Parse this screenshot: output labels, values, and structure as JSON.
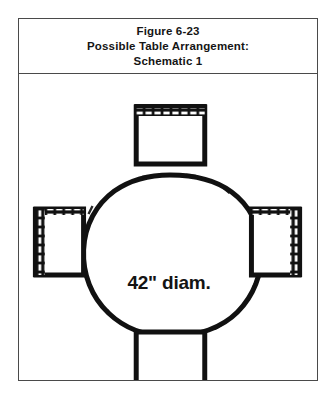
{
  "figure": {
    "title_lines": [
      "Figure 6-23",
      "Possible Table Arrangement:",
      "Schematic 1"
    ],
    "table": {
      "label": "42\" diam.",
      "shape": "circle",
      "diameter_inches": 42
    },
    "chairs": [
      {
        "position": "top",
        "back_edge": "top"
      },
      {
        "position": "left",
        "back_edge": "left"
      },
      {
        "position": "right",
        "back_edge": "right"
      },
      {
        "position": "bottom",
        "back_edge": "bottom"
      }
    ],
    "colors": {
      "ink": "#151515",
      "frame": "#4a4a4a",
      "paper": "#ffffff"
    }
  }
}
